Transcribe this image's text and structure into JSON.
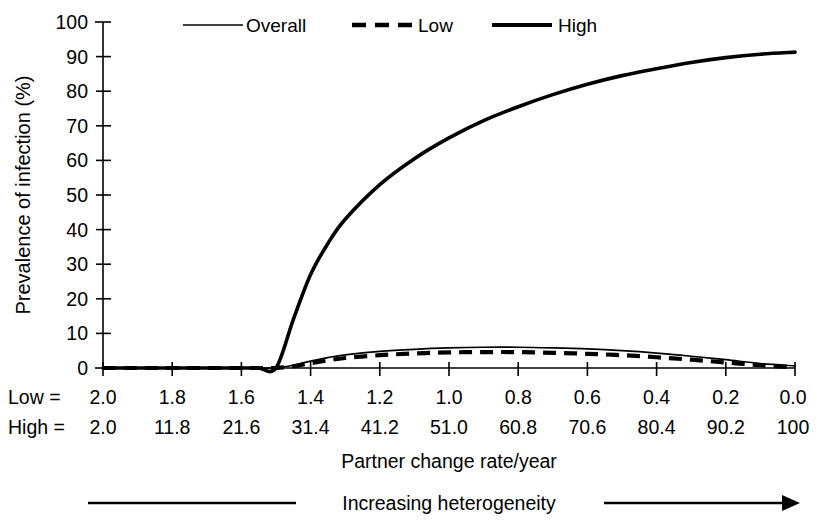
{
  "chart_data": {
    "type": "line",
    "title": "",
    "xlabel": "Partner change rate/year",
    "ylabel": "Prevalence of infection (%)",
    "ylim": [
      0,
      100
    ],
    "yticks": [
      0,
      10,
      20,
      30,
      40,
      50,
      60,
      70,
      80,
      90,
      100
    ],
    "grid": false,
    "legend_position": "top",
    "annotation": "Increasing heterogeneity",
    "x_axis_rows": [
      {
        "key": "Low =",
        "ticks": [
          "2.0",
          "1.8",
          "1.6",
          "1.4",
          "1.2",
          "1.0",
          "0.8",
          "0.6",
          "0.4",
          "0.2",
          "0.0"
        ]
      },
      {
        "key": "High =",
        "ticks": [
          "2.0",
          "11.8",
          "21.6",
          "31.4",
          "41.2",
          "51.0",
          "60.8",
          "70.6",
          "80.4",
          "90.2",
          "100"
        ]
      }
    ],
    "x": [
      2.0,
      1.9,
      1.8,
      1.7,
      1.6,
      1.55,
      1.5,
      1.45,
      1.4,
      1.35,
      1.3,
      1.2,
      1.1,
      1.0,
      0.9,
      0.8,
      0.7,
      0.6,
      0.5,
      0.4,
      0.3,
      0.2,
      0.1,
      0.0
    ],
    "series": [
      {
        "name": "Overall",
        "style": "solid-thin",
        "values": [
          0.0,
          0.0,
          0.0,
          0.0,
          0.0,
          0.0,
          0.0,
          0.8,
          2.0,
          3.0,
          3.8,
          4.8,
          5.4,
          5.8,
          6.0,
          6.0,
          5.8,
          5.5,
          5.0,
          4.3,
          3.4,
          2.4,
          1.3,
          0.6
        ]
      },
      {
        "name": "Low",
        "style": "dashed-thick",
        "values": [
          0.0,
          0.0,
          0.0,
          0.0,
          0.0,
          0.0,
          0.0,
          0.5,
          1.4,
          2.2,
          2.9,
          3.7,
          4.2,
          4.5,
          4.6,
          4.6,
          4.4,
          4.1,
          3.7,
          3.1,
          2.4,
          1.6,
          0.8,
          0.2
        ]
      },
      {
        "name": "High",
        "style": "solid-thick",
        "values": [
          0.0,
          0.0,
          0.0,
          0.0,
          0.0,
          0.0,
          0.0,
          14.0,
          27.0,
          36.0,
          43.0,
          53.0,
          60.5,
          66.5,
          71.5,
          75.5,
          79.0,
          82.0,
          84.5,
          86.5,
          88.3,
          89.7,
          90.7,
          91.3
        ]
      }
    ],
    "legend": [
      {
        "label": "Overall",
        "style": "solid-thin"
      },
      {
        "label": "Low",
        "style": "dashed-thick"
      },
      {
        "label": "High",
        "style": "solid-thick"
      }
    ],
    "colors": {
      "ink": "#000000",
      "background": "#ffffff"
    }
  }
}
